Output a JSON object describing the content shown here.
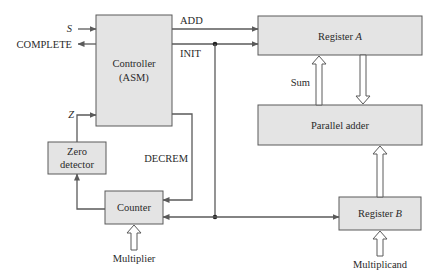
{
  "diagram": {
    "type": "block-diagram",
    "blocks": {
      "controller": {
        "line1": "Controller",
        "line2": "(ASM)"
      },
      "register_a": {
        "label": "Register ",
        "label_var": "A"
      },
      "parallel_adder": {
        "label": "Parallel adder"
      },
      "zero_detector": {
        "line1": "Zero",
        "line2": "detector"
      },
      "counter": {
        "label": "Counter"
      },
      "register_b": {
        "label": "Register ",
        "label_var": "B"
      }
    },
    "signals": {
      "s": "S",
      "complete": "COMPLETE",
      "z": "Z",
      "add": "ADD",
      "init": "INIT",
      "decrem": "DECREM",
      "sum": "Sum"
    },
    "inputs": {
      "multiplier": "Multiplier",
      "multiplicand": "Multiplicand"
    },
    "colors": {
      "block_fill": "#e4e4e4",
      "line": "#5a5a5a",
      "text": "#2a2a2a"
    }
  }
}
